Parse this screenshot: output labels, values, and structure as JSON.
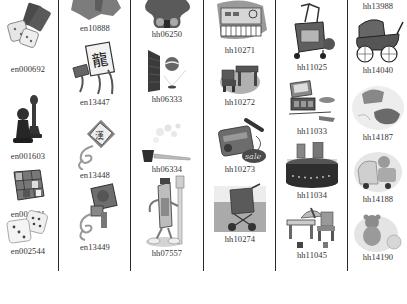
{
  "catalog": {
    "columns": [
      {
        "items": [
          {
            "code": "en000692",
            "icon": "dice-and-cards-icon"
          },
          {
            "code": "en001603",
            "icon": "chess-pieces-icon"
          },
          {
            "code": "en001691",
            "icon": "rubiks-cube-icon"
          },
          {
            "code": "en002544",
            "icon": "dice-pair-icon"
          }
        ]
      },
      {
        "items": [
          {
            "code": "en10888",
            "icon": "gray-splash-icon"
          },
          {
            "code": "en13447",
            "icon": "dragon-kite-icon"
          },
          {
            "code": "en13448",
            "icon": "character-kite-icon"
          },
          {
            "code": "en13449",
            "icon": "bird-kite-icon"
          }
        ]
      },
      {
        "items": [
          {
            "code": "hh06250",
            "icon": "teddy-bear-icon"
          },
          {
            "code": "hh06333",
            "icon": "ball-bounce-wall-icon"
          },
          {
            "code": "hh06334",
            "icon": "smoking-pipe-icon"
          },
          {
            "code": "hh07557",
            "icon": "toothpaste-character-icon"
          }
        ]
      },
      {
        "items": [
          {
            "code": "hh10271",
            "icon": "toy-keyboard-icon"
          },
          {
            "code": "hh10272",
            "icon": "kids-table-chair-icon"
          },
          {
            "code": "hh10273",
            "icon": "karaoke-sale-icon"
          },
          {
            "code": "hh10274",
            "icon": "stroller-icon"
          }
        ]
      },
      {
        "items": [
          {
            "code": "hh11025",
            "icon": "walker-cart-icon"
          },
          {
            "code": "hh11033",
            "icon": "cosmetic-set-icon"
          },
          {
            "code": "hh11034",
            "icon": "hat-box-icon"
          },
          {
            "code": "hh11045",
            "icon": "play-table-set-icon"
          }
        ]
      },
      {
        "items": [
          {
            "code": "hh13988",
            "icon": "none"
          },
          {
            "code": "hh14040",
            "icon": "vintage-pram-icon"
          },
          {
            "code": "hh14187",
            "icon": "baby-shoes-icon"
          },
          {
            "code": "hh14188",
            "icon": "toy-car-bear-icon"
          },
          {
            "code": "hh14190",
            "icon": "teddy-with-ball-icon"
          }
        ]
      }
    ]
  },
  "colors": {
    "divider": "#2a2a2a",
    "label": "#333333",
    "icon_dark": "#3a3a3a",
    "icon_mid": "#7a7a7a",
    "icon_light": "#c8c8c8"
  }
}
